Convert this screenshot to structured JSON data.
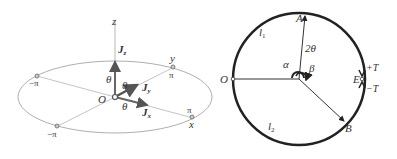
{
  "left_figure": {
    "axes": {
      "z": "z",
      "y": "y",
      "x": "x",
      "origin": "O"
    },
    "vectors": [
      {
        "name": "J",
        "sub": "z"
      },
      {
        "name": "J",
        "sub": "y"
      },
      {
        "name": "J",
        "sub": "x"
      }
    ],
    "angle_labels": [
      "θ",
      "θ",
      "θ"
    ],
    "tick_labels": {
      "y_pos": "π",
      "x_pos": "π",
      "neg_left": "−π",
      "neg_bottom": "−π"
    }
  },
  "right_figure": {
    "points": {
      "A": "A",
      "O": "O",
      "E": "E",
      "B": "B"
    },
    "arc_labels": {
      "l1": "l",
      "l1_sub": "1",
      "l2": "l",
      "l2_sub": "2"
    },
    "angle_labels": {
      "two_theta": "2θ",
      "alpha": "α",
      "beta": "β"
    },
    "torque_labels": {
      "plus": "+T",
      "minus": "−T"
    }
  },
  "colors": {
    "line": "#333333",
    "light_line": "#999999",
    "bg": "#ffffff"
  }
}
